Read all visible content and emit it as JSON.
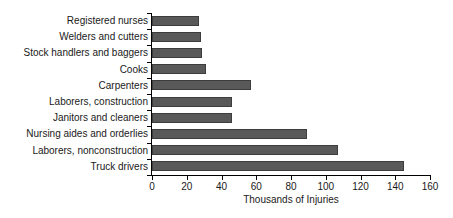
{
  "chart_data": {
    "type": "bar",
    "orientation": "horizontal",
    "title": "",
    "xlabel": "Thousands of Injuries",
    "ylabel": "",
    "xlim": [
      0,
      160
    ],
    "xticks": [
      0,
      20,
      40,
      60,
      80,
      100,
      120,
      140,
      160
    ],
    "grid": false,
    "legend": null,
    "bar_color": "#595959",
    "bar_edge_color": "#3d3d3d",
    "background_color": "#ffffff",
    "axis_color": "#000000",
    "categories": [
      "Registered nurses",
      "Welders and cutters",
      "Stock handlers and baggers",
      "Cooks",
      "Carpenters",
      "Laborers, construction",
      "Janitors and cleaners",
      "Nursing aides and orderlies",
      "Laborers, nonconstruction",
      "Truck drivers"
    ],
    "values": [
      27,
      28,
      29,
      31,
      57,
      46,
      46,
      89,
      107,
      145
    ]
  }
}
